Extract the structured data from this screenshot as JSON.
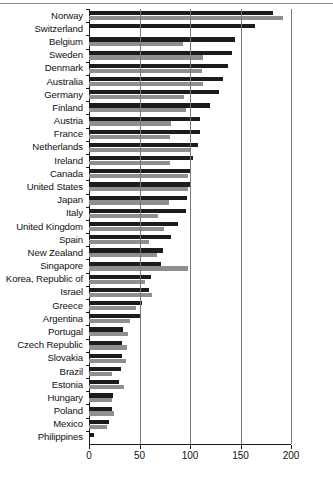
{
  "chart_data": {
    "type": "bar",
    "orientation": "horizontal",
    "title": "",
    "subtitle": "",
    "xlabel": "",
    "ylabel": "",
    "xlim": [
      0,
      200
    ],
    "xticks": [
      0,
      50,
      100,
      150,
      200
    ],
    "xtick_labels": [
      "0",
      "50",
      "100",
      "150",
      "200"
    ],
    "grid": true,
    "grid_axis": "x",
    "legend": null,
    "legend_position": "none",
    "colors": {
      "series_1": "#1c1c1c",
      "series_2": "#8f8f8f",
      "axis": "#1a1a1a",
      "grid": "#777777",
      "background": "#ffffff",
      "text": "#111111"
    },
    "categories": [
      "Norway",
      "Switzerland",
      "Belgium",
      "Sweden",
      "Denmark",
      "Australia",
      "Germany",
      "Finland",
      "Austria",
      "France",
      "Netherlands",
      "Ireland",
      "Canada",
      "United States",
      "Japan",
      "Italy",
      "United Kingdom",
      "Spain",
      "New Zealand",
      "Singapore",
      "Korea, Republic of",
      "Israel",
      "Greece",
      "Argentina",
      "Portugal",
      "Czech Republic",
      "Slovakia",
      "Brazil",
      "Estonia",
      "Hungary",
      "Poland",
      "Mexico",
      "Philippines"
    ],
    "series": [
      {
        "name": "series-1",
        "color": "#1c1c1c",
        "values": [
          182,
          164,
          145,
          142,
          138,
          133,
          129,
          120,
          110,
          110,
          108,
          103,
          101,
          100,
          97,
          96,
          88,
          81,
          73,
          71,
          61,
          59,
          52,
          51,
          34,
          33,
          33,
          32,
          30,
          24,
          23,
          20,
          5
        ]
      },
      {
        "name": "series-2",
        "color": "#8f8f8f",
        "values": [
          192,
          0,
          93,
          113,
          112,
          113,
          94,
          96,
          81,
          80,
          101,
          80,
          98,
          98,
          79,
          68,
          74,
          59,
          67,
          98,
          55,
          62,
          47,
          41,
          39,
          38,
          37,
          23,
          35,
          23,
          25,
          18,
          0
        ]
      }
    ]
  }
}
